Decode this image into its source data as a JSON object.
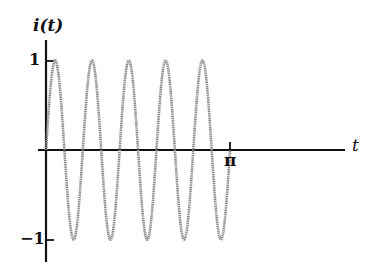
{
  "chart_data": {
    "type": "line",
    "title": "",
    "function": "i(t) = sin(10t)",
    "xlabel": "t",
    "ylabel": "i(t)",
    "x_ticks": [
      {
        "value": 3.14159,
        "label": "π"
      }
    ],
    "y_ticks": [
      {
        "value": 1,
        "label": "1"
      },
      {
        "value": -1,
        "label": "−1"
      }
    ],
    "xlim": [
      0,
      3.14159
    ],
    "ylim": [
      -1,
      1
    ],
    "grid": false,
    "legend": null,
    "series": [
      {
        "name": "i(t)",
        "color": "#8a8a8a",
        "angular_frequency": 10,
        "amplitude": 1,
        "cycles": 5,
        "x": [
          0,
          0.157,
          0.314,
          0.471,
          0.628,
          0.785,
          0.942,
          1.1,
          1.257,
          1.414,
          1.571,
          1.728,
          1.885,
          2.042,
          2.199,
          2.356,
          2.513,
          2.67,
          2.827,
          2.985,
          3.142
        ],
        "values": [
          0,
          1,
          0,
          -1,
          0,
          1,
          0,
          -1,
          0,
          1,
          0,
          -1,
          0,
          1,
          0,
          -1,
          0,
          1,
          0,
          -1,
          0
        ]
      }
    ]
  },
  "labels": {
    "y_axis": "i(t)",
    "x_axis": "t",
    "y_tick_pos": "1",
    "y_tick_neg": "−1",
    "x_tick_pi": "π"
  },
  "layout": {
    "origin_x": 46,
    "origin_y": 150,
    "px_per_unit_x": 58.6,
    "px_per_unit_y": 89.5,
    "axis_color": "#111111"
  }
}
